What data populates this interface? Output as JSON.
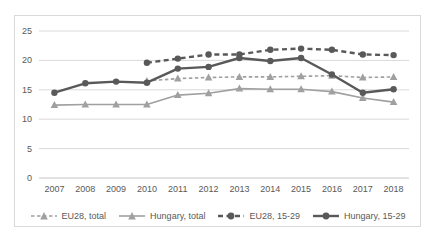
{
  "chart_box": {
    "border_color": "#d9d9d9",
    "background": "#ffffff",
    "tick_label_color": "#595959"
  },
  "chart_data": {
    "type": "line",
    "title": "",
    "categories": [
      "2007",
      "2008",
      "2009",
      "2010",
      "2011",
      "2012",
      "2013",
      "2014",
      "2015",
      "2016",
      "2017",
      "2018"
    ],
    "y_ticks": [
      0,
      5,
      10,
      15,
      20,
      25
    ],
    "ylim": [
      0,
      25
    ],
    "grid": true,
    "gridline_color": "#d9d9d9",
    "axis_line_color": "#c6c6c6",
    "legend_position": "bottom",
    "series": [
      {
        "name": "EU28, total",
        "color": "#a0a0a0",
        "line_style": "dashed",
        "dash": "3.5 2.5",
        "marker": "triangle",
        "line_width": 1.6,
        "values": [
          null,
          null,
          null,
          16.5,
          16.9,
          17.1,
          17.2,
          17.2,
          17.3,
          17.4,
          17.1,
          17.2
        ]
      },
      {
        "name": "Hungary, total",
        "color": "#a0a0a0",
        "line_style": "solid",
        "dash": null,
        "marker": "triangle",
        "line_width": 1.6,
        "values": [
          12.4,
          12.5,
          12.5,
          12.5,
          14.1,
          14.4,
          15.2,
          15.1,
          15.1,
          14.7,
          13.6,
          12.9
        ]
      },
      {
        "name": "EU28, 15-29",
        "color": "#595959",
        "line_style": "dashed",
        "dash": "5 3.5",
        "marker": "circle",
        "line_width": 2.4,
        "values": [
          null,
          null,
          null,
          19.6,
          20.3,
          21.0,
          21.0,
          21.8,
          22.0,
          21.8,
          21.0,
          20.9
        ]
      },
      {
        "name": "Hungary, 15-29",
        "color": "#595959",
        "line_style": "solid",
        "dash": null,
        "marker": "circle",
        "line_width": 2.4,
        "values": [
          14.5,
          16.1,
          16.4,
          16.2,
          18.6,
          18.9,
          20.4,
          19.9,
          20.4,
          17.6,
          14.5,
          15.1
        ]
      }
    ]
  }
}
